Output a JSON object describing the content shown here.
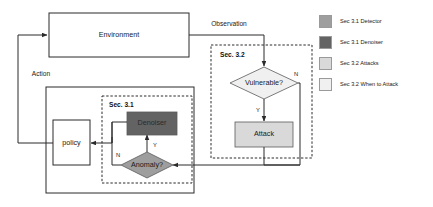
{
  "diagram": {
    "nodes": {
      "environment": {
        "label": "Environment"
      },
      "policy": {
        "label": "policy"
      },
      "denoiser": {
        "label": "Denoiser"
      },
      "anomaly": {
        "label": "Anomaly?"
      },
      "vulnerable": {
        "label": "Vulnerable?"
      },
      "attack": {
        "label": "Attack"
      }
    },
    "groups": {
      "sec31": {
        "label": "Sec. 3.1"
      },
      "sec32": {
        "label": "Sec. 3.2"
      }
    },
    "edge_labels": {
      "observation": "Observation",
      "action": "Action"
    },
    "branch_labels": {
      "anomaly_yes": "Y",
      "anomaly_no": "N",
      "vulnerable_yes": "Y",
      "vulnerable_no": "N"
    }
  },
  "legend": {
    "items": [
      {
        "label": "Sec 3.1 Detector",
        "color": "#9e9e9e"
      },
      {
        "label": "Sec 3.1 Denoiser",
        "color": "#636363"
      },
      {
        "label": "Sec 3.2 Attacks",
        "color": "#d9d9d9"
      },
      {
        "label": "Sec 3.2 When to Attack",
        "color": "#f0f0f0"
      }
    ]
  },
  "colors": {
    "detector": "#9e9e9e",
    "denoiser": "#636363",
    "attacks": "#d9d9d9",
    "when_to_attack": "#f0f0f0",
    "stroke": "#2b2b2b",
    "background": "#ffffff"
  }
}
